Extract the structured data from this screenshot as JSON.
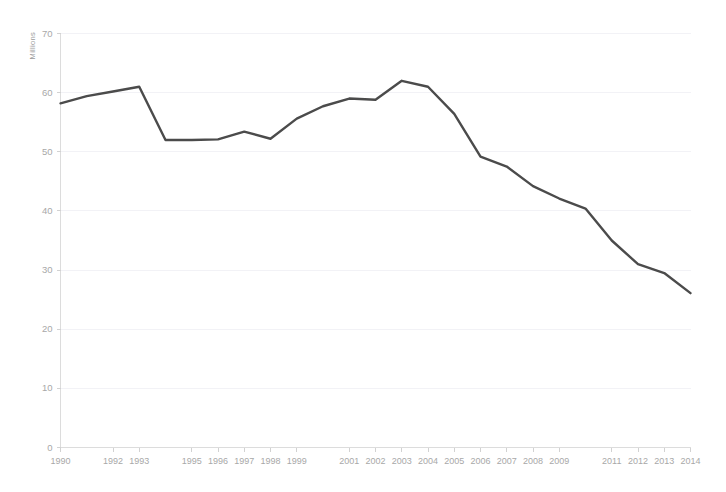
{
  "chart_data": {
    "type": "line",
    "title": "",
    "subtitle": "",
    "xlabel": "",
    "ylabel": "Millions",
    "ylim": [
      0,
      70
    ],
    "yticks": [
      0,
      10,
      20,
      30,
      40,
      50,
      60,
      70
    ],
    "ytick_labels": [
      "0",
      "10",
      "20",
      "30",
      "40",
      "50",
      "60",
      "70"
    ],
    "grid": true,
    "legend": false,
    "legend_position": "none",
    "x": [
      1990,
      1991,
      1992,
      1993,
      1994,
      1995,
      1996,
      1997,
      1998,
      1999,
      2000,
      2001,
      2002,
      2003,
      2004,
      2005,
      2006,
      2007,
      2008,
      2009,
      2010,
      2011,
      2012,
      2013,
      2014
    ],
    "xtick_labels": [
      "1990",
      "1992",
      "1993",
      "1995",
      "1996",
      "1997",
      "1998",
      "1999",
      "2001",
      "2002",
      "2003",
      "2004",
      "2005",
      "2006",
      "2007",
      "2008",
      "2009",
      "2011",
      "2012",
      "2013",
      "2014"
    ],
    "xtick_values": [
      1990,
      1992,
      1993,
      1995,
      1996,
      1997,
      1998,
      1999,
      2001,
      2002,
      2003,
      2004,
      2005,
      2006,
      2007,
      2008,
      2009,
      2011,
      2012,
      2013,
      2014
    ],
    "series": [
      {
        "name": "Millions",
        "color": "#4b4b4b",
        "values": [
          58.2,
          59.4,
          60.2,
          61.0,
          52.0,
          52.0,
          52.1,
          53.4,
          52.2,
          55.6,
          57.7,
          59.0,
          58.8,
          62.0,
          61.0,
          56.4,
          49.2,
          47.5,
          44.2,
          42.1,
          40.4,
          35.0,
          31.0,
          29.5,
          26.1
        ]
      }
    ],
    "colors": {
      "line": "#4b4b4b",
      "grid": "#f2f2f6",
      "axis": "#dcdcdc",
      "tick_text": "#a8a8a8",
      "background": "#ffffff"
    }
  }
}
